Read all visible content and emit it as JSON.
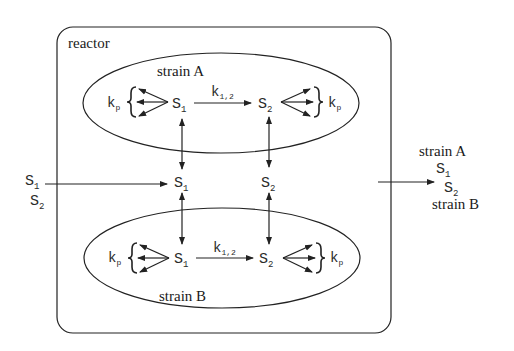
{
  "reactor": {
    "label": "reactor"
  },
  "strain_a": {
    "label": "strain A",
    "s1": {
      "main": "S",
      "sub": "1"
    },
    "s2": {
      "main": "S",
      "sub": "2"
    },
    "rate": {
      "main": "k",
      "sub": "1,2"
    },
    "kp_left": {
      "main": "k",
      "sub": "p"
    },
    "kp_right": {
      "main": "k",
      "sub": "p"
    }
  },
  "strain_b": {
    "label": "strain B",
    "s1": {
      "main": "S",
      "sub": "1"
    },
    "s2": {
      "main": "S",
      "sub": "2"
    },
    "rate": {
      "main": "k",
      "sub": "1,2"
    },
    "kp_left": {
      "main": "k",
      "sub": "p"
    },
    "kp_right": {
      "main": "k",
      "sub": "p"
    }
  },
  "medium": {
    "s1": {
      "main": "S",
      "sub": "1"
    },
    "s2": {
      "main": "S",
      "sub": "2"
    }
  },
  "inflow": {
    "s1": {
      "main": "S",
      "sub": "1"
    },
    "s2": {
      "main": "S",
      "sub": "2"
    }
  },
  "outflow": {
    "strain_a": "strain A",
    "s1": {
      "main": "S",
      "sub": "1"
    },
    "s2": {
      "main": "S",
      "sub": "2"
    },
    "strain_b": "strain B"
  }
}
